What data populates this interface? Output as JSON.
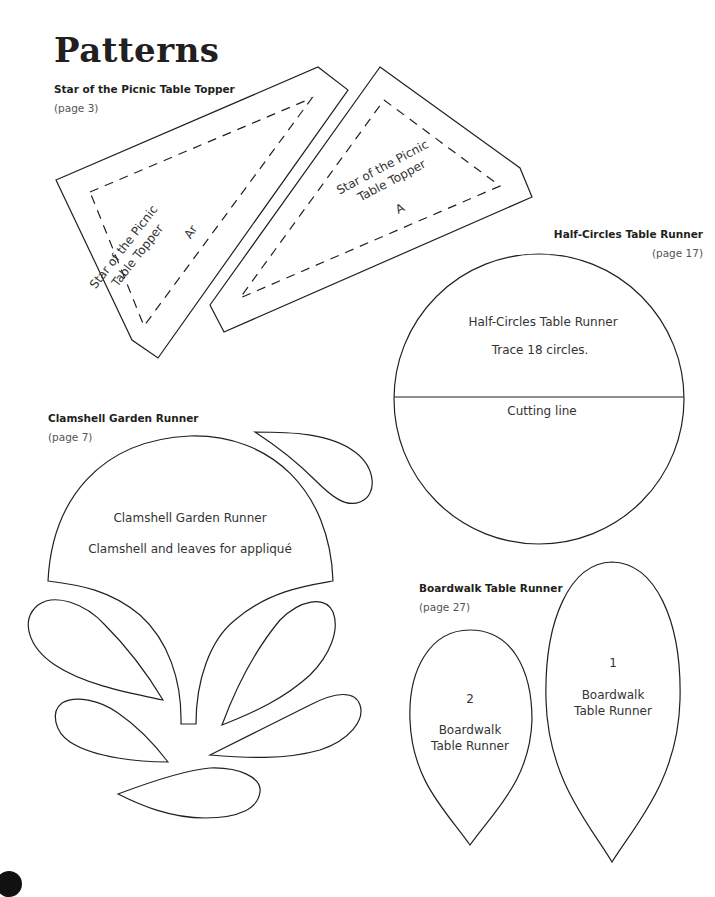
{
  "page": {
    "title": "Patterns"
  },
  "sections": {
    "star": {
      "title": "Star of the Picnic Table Topper",
      "page_ref": "(page 3)",
      "pieces": [
        {
          "label_line1": "Star of the Picnic",
          "label_line2": "Table Topper",
          "piece_id": "Ar"
        },
        {
          "label_line1": "Star of the Picnic",
          "label_line2": "Table Topper",
          "piece_id": "A"
        }
      ]
    },
    "half_circles": {
      "title": "Half-Circles Table Runner",
      "page_ref": "(page 17)",
      "label": "Half-Circles Table Runner",
      "instruction": "Trace 18 circles.",
      "cutting_line": "Cutting line"
    },
    "clamshell": {
      "title": "Clamshell Garden Runner",
      "page_ref": "(page 7)",
      "label": "Clamshell Garden Runner",
      "subtitle": "Clamshell and leaves for appliqué"
    },
    "boardwalk": {
      "title": "Boardwalk Table Runner",
      "page_ref": "(page 27)",
      "pieces": [
        {
          "number": "2",
          "label_line1": "Boardwalk",
          "label_line2": "Table Runner"
        },
        {
          "number": "1",
          "label_line1": "Boardwalk",
          "label_line2": "Table Runner"
        }
      ]
    }
  },
  "colors": {
    "ink": "#231f20",
    "muted": "#555555",
    "paper": "#ffffff"
  }
}
